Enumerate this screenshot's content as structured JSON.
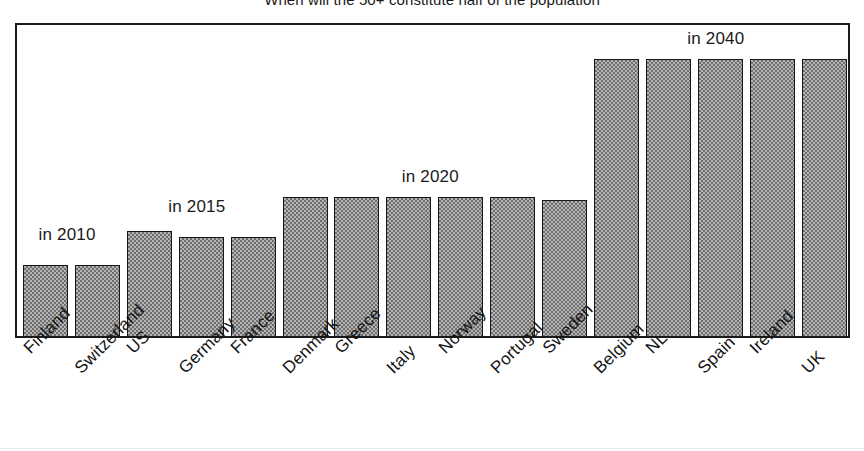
{
  "chart_data": {
    "type": "bar",
    "title": "When will the 50+ constitute half of the population",
    "xlabel": "",
    "ylabel": "",
    "ylim": [
      0,
      100
    ],
    "grid": false,
    "legend": "none",
    "categories": [
      "Finland",
      "Switzerland",
      "US",
      "Germany",
      "France",
      "Denmark",
      "Greece",
      "Italy",
      "Norway",
      "Portugal",
      "Sweden",
      "Belgium",
      "NL",
      "Spain",
      "Ireland",
      "UK"
    ],
    "values": [
      23,
      23,
      34,
      32,
      32,
      45,
      45,
      45,
      45,
      45,
      44,
      89,
      89,
      89,
      89,
      89
    ],
    "value_unit": "relative bar height (%)",
    "annotations": [
      {
        "text": "in 2010",
        "group": [
          "Finland",
          "Switzerland"
        ]
      },
      {
        "text": "in 2015",
        "group": [
          "US",
          "Germany",
          "France"
        ]
      },
      {
        "text": "in 2020",
        "group": [
          "Denmark",
          "Greece",
          "Italy",
          "Norway",
          "Portugal",
          "Sweden"
        ]
      },
      {
        "text": "in 2040",
        "group": [
          "Belgium",
          "NL",
          "Spain",
          "Ireland",
          "UK"
        ]
      }
    ],
    "colors": {
      "bar_fill": "#b4b4b4",
      "bar_pattern": "#6e6e6e",
      "bar_border": "#181818",
      "frame": "#1c1c1c",
      "text": "#141414",
      "background": "#ffffff"
    }
  }
}
